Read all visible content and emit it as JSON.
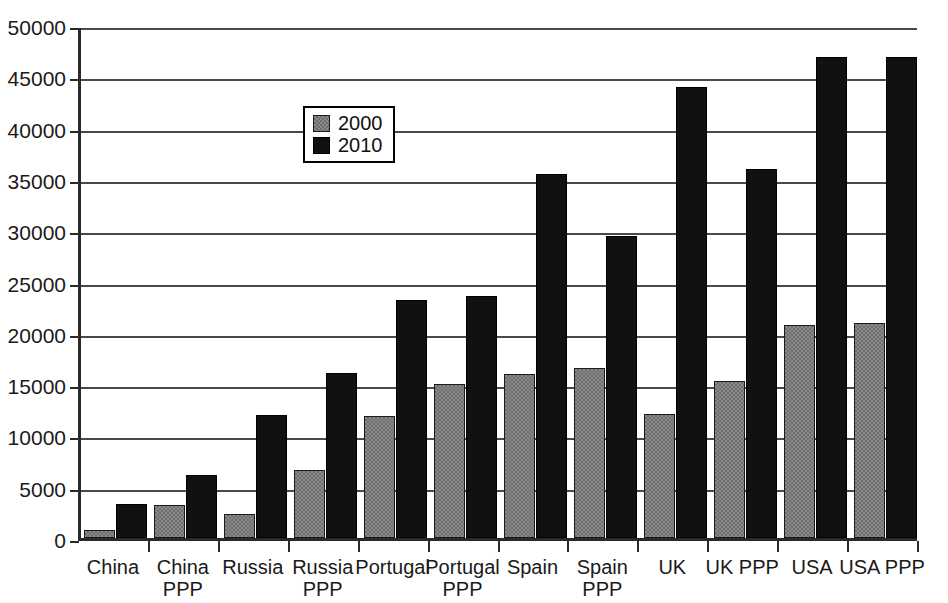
{
  "chart_data": {
    "type": "bar",
    "title": "",
    "xlabel": "",
    "ylabel": "",
    "ylim": [
      0,
      50000
    ],
    "ytick_values": [
      0,
      5000,
      10000,
      15000,
      20000,
      25000,
      30000,
      35000,
      40000,
      45000,
      50000
    ],
    "ytick_labels": [
      "0",
      "5000",
      "10000",
      "15000",
      "20000",
      "25000",
      "30000",
      "35000",
      "40000",
      "45000",
      "50000"
    ],
    "grid": true,
    "legend_position": "upper-left-inside",
    "categories": [
      "China",
      "China PPP",
      "Russia",
      "Russia PPP",
      "Portugal",
      "Portugal PPP",
      "Spain",
      "Spain PPP",
      "UK",
      "UK PPP",
      "USA",
      "USA PPP"
    ],
    "category_lines": [
      [
        "China"
      ],
      [
        "China",
        "PPP"
      ],
      [
        "Russia"
      ],
      [
        "Russia",
        "PPP"
      ],
      [
        "Portugal"
      ],
      [
        "Portugal",
        "PPP"
      ],
      [
        "Spain"
      ],
      [
        "Spain",
        "PPP"
      ],
      [
        "UK"
      ],
      [
        "UK PPP"
      ],
      [
        "USA"
      ],
      [
        "USA PPP"
      ]
    ],
    "series": [
      {
        "name": "2000",
        "color": "#8a8a8a",
        "values": [
          800,
          3200,
          2300,
          6600,
          11900,
          15000,
          16000,
          16600,
          12100,
          15300,
          20800,
          21000
        ]
      },
      {
        "name": "2010",
        "color": "#111111",
        "values": [
          3300,
          6100,
          12000,
          16100,
          23200,
          23600,
          35500,
          29400,
          44000,
          36000,
          46900,
          46900
        ]
      }
    ]
  },
  "legend": {
    "items": [
      {
        "label": "2000",
        "swatch": "gray-square"
      },
      {
        "label": "2010",
        "swatch": "black-square"
      }
    ]
  }
}
